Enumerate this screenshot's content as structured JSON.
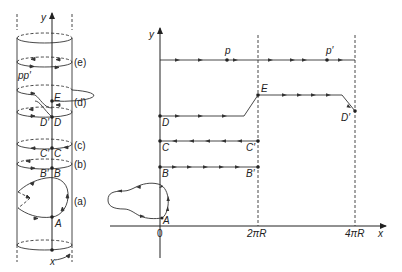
{
  "figure": {
    "cylinder": {
      "axis_labels": {
        "y": "y",
        "x": "x"
      },
      "section_labels": [
        "(a)",
        "(b)",
        "(c)",
        "(d)",
        "(e)"
      ],
      "point_labels": {
        "pp": "pp′",
        "E": "E",
        "D_prime": "D′",
        "D": "D",
        "C_prime": "C′",
        "C": "C",
        "B_prime": "B′",
        "B": "B",
        "A": "A"
      }
    },
    "plane": {
      "axis_labels": {
        "y": "y",
        "x": "x"
      },
      "tick_labels": [
        "0",
        "2πR",
        "4πR"
      ],
      "point_labels": {
        "p": "p",
        "p_prime": "p′",
        "E": "E",
        "D": "D",
        "D_prime": "D′",
        "C": "C",
        "C_prime": "C′",
        "B": "B",
        "B_prime": "B′",
        "A": "A"
      }
    }
  }
}
